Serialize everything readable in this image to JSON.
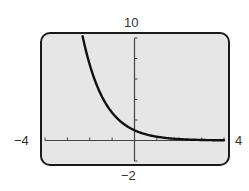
{
  "window_labels": {
    "ymax": "10",
    "ymin": "−2",
    "xmin": "−4",
    "xmax": "4"
  },
  "colors": {
    "screen_fill": "#e6e6e6",
    "frame": "#1a1a1a",
    "curve": "#111111",
    "axes": "#444444"
  },
  "chart_data": {
    "type": "line",
    "title": "",
    "xlabel": "",
    "ylabel": "",
    "xlim": [
      -4,
      4
    ],
    "ylim": [
      -2,
      10
    ],
    "x_ticks_step": 1,
    "y_ticks_step": 2,
    "grid": false,
    "legend": null,
    "series": [
      {
        "name": "y = e^(-x)",
        "x": [
          -2.3,
          -2.0,
          -1.5,
          -1.0,
          -0.5,
          0.0,
          0.5,
          1.0,
          1.5,
          2.0,
          2.5,
          3.0,
          3.5,
          4.0
        ],
        "y": [
          9.97,
          7.39,
          4.48,
          2.72,
          1.65,
          1.0,
          0.61,
          0.37,
          0.22,
          0.14,
          0.08,
          0.05,
          0.03,
          0.02
        ]
      }
    ]
  }
}
